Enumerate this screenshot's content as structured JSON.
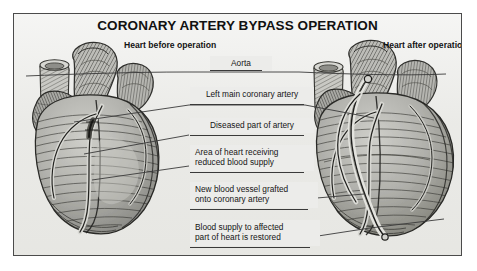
{
  "figure": {
    "title": "CORONARY ARTERY BYPASS OPERATION",
    "background_color": "#e9e9e6",
    "frame_color": "#4b4b4b",
    "ink_color": "#3a3a3a"
  },
  "captions": {
    "before": "Heart before operation",
    "after": "Heart after operation"
  },
  "labels": [
    {
      "id": "aorta",
      "text": "Aorta",
      "align": "center"
    },
    {
      "id": "left-main",
      "text": "Left main coronary artery",
      "align": "center"
    },
    {
      "id": "diseased",
      "text": "Diseased part of artery",
      "align": "center"
    },
    {
      "id": "reduced-supply",
      "line1": "Area of heart receiving",
      "line2": "reduced blood supply",
      "align": "left"
    },
    {
      "id": "graft",
      "line1": "New blood vessel grafted",
      "line2": "onto coronary artery",
      "align": "left"
    },
    {
      "id": "restored",
      "line1": "Blood supply to affected",
      "line2": "part of heart is restored",
      "align": "left"
    }
  ],
  "diagram": {
    "type": "medical-illustration",
    "panels": [
      {
        "name": "heart-before-operation",
        "side": "left",
        "depicts": "human heart with diseased left main coronary artery and region of reduced blood supply"
      },
      {
        "name": "heart-after-operation",
        "side": "right",
        "depicts": "human heart with new blood vessel grafted onto coronary artery restoring blood supply"
      }
    ],
    "annotations": [
      "Aorta",
      "Left main coronary artery",
      "Diseased part of artery",
      "Area of heart receiving reduced blood supply",
      "New blood vessel grafted onto coronary artery",
      "Blood supply to affected part of heart is restored"
    ]
  }
}
